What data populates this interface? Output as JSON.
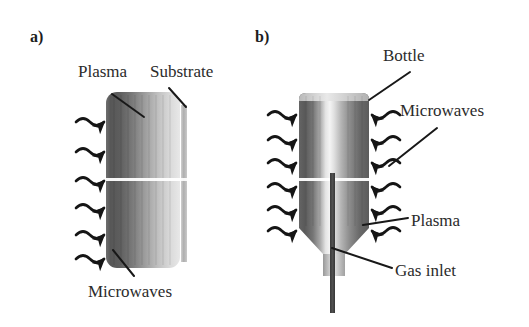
{
  "figure": {
    "type": "schematic-diagram",
    "background_color": "#ffffff"
  },
  "panels": [
    {
      "tag": "a)",
      "tag_x": 30,
      "tag_y": 28,
      "description": "Cylindrical microwave plasma source with a flat substrate",
      "labels": [
        {
          "name": "plasma",
          "text": "Plasma",
          "x": 78,
          "y": 62
        },
        {
          "name": "substrate",
          "text": "Substrate",
          "x": 150,
          "y": 62
        },
        {
          "name": "microwaves",
          "text": "Microwaves",
          "x": 88,
          "y": 282
        }
      ]
    },
    {
      "tag": "b)",
      "tag_x": 255,
      "tag_y": 28,
      "description": "Bottle-shaped microwave plasma reactor with axial gas inlet",
      "labels": [
        {
          "name": "bottle",
          "text": "Bottle",
          "x": 383,
          "y": 46
        },
        {
          "name": "microwaves",
          "text": "Microwaves",
          "x": 400,
          "y": 101
        },
        {
          "name": "plasma",
          "text": "Plasma",
          "x": 411,
          "y": 211
        },
        {
          "name": "gas-inlet",
          "text": "Gas inlet",
          "x": 395,
          "y": 261
        }
      ]
    }
  ],
  "colors": {
    "ink": "#2b2b2b",
    "stroke": "#1a1a1a",
    "plasma_dark": "#555555",
    "plasma_mid": "#9a9a9a",
    "plasma_light": "#e2e2e2",
    "substrate": "#b8b8b8",
    "gas_inlet": "#454545",
    "highlight_line": "#ffffff",
    "background": "#ffffff"
  },
  "geometry": {
    "panel_a": {
      "cylinder": {
        "x": 106,
        "y": 92,
        "width": 74,
        "height": 176
      },
      "substrate_bar": {
        "x": 181,
        "y": 105,
        "width": 6,
        "height": 157
      },
      "white_band_y": 180,
      "wave_count": 6,
      "wave_rows_y": [
        122,
        152,
        181,
        208,
        235,
        259
      ]
    },
    "panel_b": {
      "bottle_body": {
        "x": 299,
        "y": 92,
        "width": 70,
        "height": 148
      },
      "bottle_neck": {
        "x": 323,
        "y": 240,
        "width": 22,
        "height": 36
      },
      "gas_inlet_tube": {
        "x": 330,
        "y": 173,
        "width": 5,
        "height": 140
      },
      "white_band_y": 180,
      "wave_count_left": 6,
      "wave_count_right": 6,
      "wave_rows_y": [
        115,
        140,
        163,
        187,
        210,
        231
      ]
    }
  }
}
